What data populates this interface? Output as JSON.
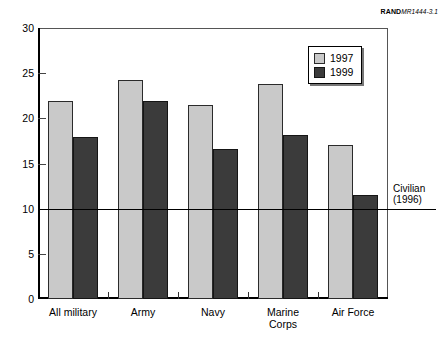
{
  "source_tag": {
    "rand": "RAND",
    "document": "MR1444-3.1"
  },
  "chart_data": {
    "type": "bar",
    "title": "",
    "subtitle": "",
    "xlabel": "",
    "ylabel": "",
    "ylim": [
      0,
      30
    ],
    "yticks": [
      0,
      5,
      10,
      15,
      20,
      25,
      30
    ],
    "ytick_labels": [
      "0",
      "5",
      "10",
      "15",
      "20",
      "25",
      "30"
    ],
    "grid": false,
    "legend_position": "top-right",
    "categories": [
      "All military",
      "Army",
      "Navy",
      "Marine\nCorps",
      "Air Force"
    ],
    "series": [
      {
        "name": "1997",
        "color": "#c9c9c9",
        "values": [
          21.9,
          24.2,
          21.5,
          23.8,
          17.1
        ]
      },
      {
        "name": "1999",
        "color": "#3b3b3b",
        "values": [
          17.9,
          21.9,
          16.6,
          18.2,
          11.5
        ]
      }
    ],
    "annotations": [
      {
        "name": "civilian-reference-line",
        "label": "Civilian\n(1996)",
        "value": 10.0,
        "orientation": "horizontal"
      }
    ]
  }
}
